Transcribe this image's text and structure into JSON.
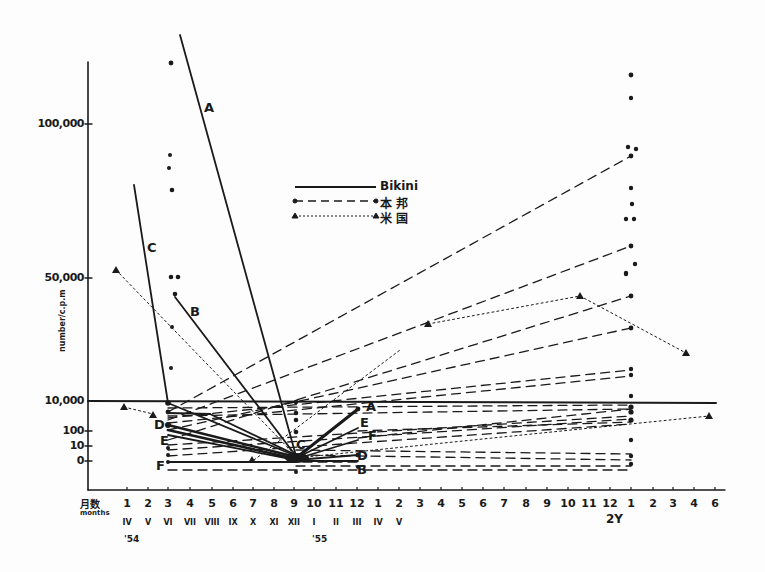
{
  "chart_data": {
    "type": "line",
    "title": "",
    "xlabel": "月数 months",
    "ylabel": "number/c.p.m",
    "y_tick_labels": [
      "100,000",
      "50,000",
      "10,000",
      "100",
      "10",
      "0"
    ],
    "y_tick_values": [
      100000,
      50000,
      10000,
      100,
      10,
      0
    ],
    "x_tick_labels": [
      "1",
      "2",
      "3",
      "4",
      "5",
      "6",
      "7",
      "8",
      "9",
      "10",
      "11",
      "12",
      "1",
      "2",
      "3",
      "4",
      "5",
      "6",
      "7",
      "8",
      "9",
      "10",
      "11",
      "12",
      "1",
      "2",
      "3",
      "4",
      "6"
    ],
    "x_roman_labels": [
      "IV",
      "V",
      "VI",
      "VII",
      "VIII",
      "IX",
      "X",
      "XI",
      "XII",
      "I",
      "II",
      "III",
      "IV",
      "V"
    ],
    "year_labels": [
      "'54",
      "'55",
      "2Y"
    ],
    "legend": [
      {
        "label": "Bikini",
        "style": "solid"
      },
      {
        "label": "本 邦",
        "style": "dashed-dot-marker"
      },
      {
        "label": "米 国",
        "style": "dotted-triangle-marker"
      }
    ],
    "series_labels": [
      "A",
      "B",
      "C",
      "D",
      "E",
      "F"
    ],
    "series": [
      {
        "name": "Bikini A",
        "group": "Bikini",
        "points": [
          [
            4.5,
            130000
          ],
          [
            9,
            0
          ]
        ]
      },
      {
        "name": "Bikini B",
        "group": "Bikini",
        "points": [
          [
            4,
            45000
          ],
          [
            9,
            0
          ]
        ]
      },
      {
        "name": "Bikini C",
        "group": "Bikini",
        "points": [
          [
            3,
            80000
          ],
          [
            3,
            10000
          ],
          [
            9,
            0
          ]
        ]
      },
      {
        "name": "Bikini D",
        "group": "Bikini",
        "points": [
          [
            3,
            200
          ],
          [
            9,
            0
          ]
        ]
      },
      {
        "name": "Bikini E",
        "group": "Bikini",
        "points": [
          [
            3,
            60
          ],
          [
            9,
            0
          ]
        ]
      },
      {
        "name": "Bikini F",
        "group": "Bikini",
        "points": [
          [
            3,
            0
          ],
          [
            9,
            0
          ]
        ]
      },
      {
        "name": "Bikini A (post)",
        "group": "Bikini",
        "points": [
          [
            9,
            0
          ],
          [
            12,
            10000
          ]
        ]
      },
      {
        "name": "Bikini E (post)",
        "group": "Bikini",
        "points": [
          [
            9,
            0
          ],
          [
            12,
            1000
          ]
        ]
      },
      {
        "name": "Bikini F (post)",
        "group": "Bikini",
        "points": [
          [
            9,
            0
          ],
          [
            12,
            100
          ]
        ]
      },
      {
        "name": "US dotted 1",
        "group": "米国",
        "points": [
          [
            1,
            52000
          ],
          [
            9,
            0
          ]
        ]
      },
      {
        "name": "US dotted 2",
        "group": "米国",
        "points": [
          [
            1,
            1000
          ],
          [
            3,
            600
          ]
        ]
      },
      {
        "name": "US dotted 3",
        "group": "米国",
        "points": [
          [
            15,
            30000
          ],
          [
            22,
            40000
          ],
          [
            27,
            22000
          ]
        ]
      },
      {
        "name": "US dotted 4",
        "group": "米国",
        "points": [
          [
            9,
            0
          ],
          [
            29,
            1000
          ]
        ]
      }
    ],
    "grid": false
  },
  "axis": {
    "y_labels": [
      {
        "text": "100,000",
        "y": 124
      },
      {
        "text": "50,000",
        "y": 278
      },
      {
        "text": "10,000",
        "y": 401
      },
      {
        "text": "100",
        "y": 431
      },
      {
        "text": "10",
        "y": 446
      },
      {
        "text": "0",
        "y": 461
      }
    ],
    "ylabel": "number/c.p.m",
    "xlabel_jp": "月数",
    "xlabel_en": "months",
    "x_ticks": [
      {
        "t": "1",
        "x": 127
      },
      {
        "t": "2",
        "x": 148
      },
      {
        "t": "3",
        "x": 168
      },
      {
        "t": "4",
        "x": 190
      },
      {
        "t": "5",
        "x": 212
      },
      {
        "t": "6",
        "x": 233
      },
      {
        "t": "7",
        "x": 253
      },
      {
        "t": "8",
        "x": 274
      },
      {
        "t": "9",
        "x": 294
      },
      {
        "t": "10",
        "x": 314
      },
      {
        "t": "11",
        "x": 336
      },
      {
        "t": "12",
        "x": 357
      },
      {
        "t": "1",
        "x": 378
      },
      {
        "t": "2",
        "x": 399
      },
      {
        "t": "3",
        "x": 420
      },
      {
        "t": "4",
        "x": 441
      },
      {
        "t": "5",
        "x": 462
      },
      {
        "t": "6",
        "x": 483
      },
      {
        "t": "7",
        "x": 504
      },
      {
        "t": "8",
        "x": 526
      },
      {
        "t": "9",
        "x": 547
      },
      {
        "t": "10",
        "x": 568
      },
      {
        "t": "11",
        "x": 589
      },
      {
        "t": "12",
        "x": 610
      },
      {
        "t": "1",
        "x": 631
      },
      {
        "t": "2",
        "x": 653
      },
      {
        "t": "3",
        "x": 673
      },
      {
        "t": "4",
        "x": 694
      },
      {
        "t": "6",
        "x": 715
      }
    ],
    "roman": [
      {
        "t": "IV",
        "x": 127
      },
      {
        "t": "V",
        "x": 148
      },
      {
        "t": "VI",
        "x": 168
      },
      {
        "t": "VII",
        "x": 190
      },
      {
        "t": "VIII",
        "x": 212
      },
      {
        "t": "IX",
        "x": 233
      },
      {
        "t": "X",
        "x": 253
      },
      {
        "t": "XI",
        "x": 274
      },
      {
        "t": "XII",
        "x": 294
      },
      {
        "t": "I",
        "x": 314
      },
      {
        "t": "II",
        "x": 336
      },
      {
        "t": "III",
        "x": 357
      },
      {
        "t": "IV",
        "x": 378
      },
      {
        "t": "V",
        "x": 399
      }
    ],
    "years": [
      {
        "t": "'54",
        "x": 130
      },
      {
        "t": "'55",
        "x": 318
      },
      {
        "t": "2Y",
        "x": 612
      }
    ]
  },
  "legend": {
    "bikini": "Bikini",
    "japan": "本 邦",
    "usa": "米 国"
  },
  "labels": {
    "A1": "A",
    "B1": "B",
    "C1": "C",
    "D1": "D",
    "E1": "E",
    "F1": "F",
    "C2": "C",
    "A2": "A",
    "E2": "E",
    "F2": "F",
    "D2": "D",
    "B2": "B"
  }
}
